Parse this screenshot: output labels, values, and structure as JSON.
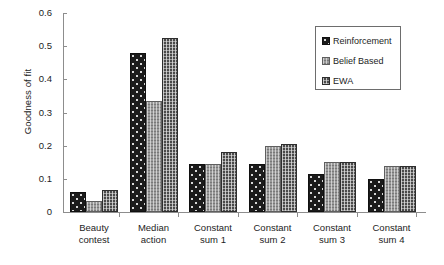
{
  "chart_data": {
    "type": "bar",
    "title": "",
    "xlabel": "",
    "ylabel": "Goodness of fit",
    "ylim": [
      0,
      0.6
    ],
    "ytick_values": [
      0,
      0.1,
      0.2,
      0.3,
      0.4,
      0.5,
      0.6
    ],
    "ytick_labels": [
      "0",
      "0.1",
      "0.2",
      "0.3",
      "0.4",
      "0.5",
      "0.6"
    ],
    "grid": false,
    "legend_position": "top-right",
    "categories": [
      "Beauty contest",
      "Median action",
      "Constant sum 1",
      "Constant sum 2",
      "Constant sum 3",
      "Constant sum 4"
    ],
    "category_lines": [
      [
        "Beauty",
        "contest"
      ],
      [
        "Median",
        "action"
      ],
      [
        "Constant",
        "sum 1"
      ],
      [
        "Constant",
        "sum 2"
      ],
      [
        "Constant",
        "sum 3"
      ],
      [
        "Constant",
        "sum 4"
      ]
    ],
    "series": [
      {
        "name": "Reinforcement",
        "pattern": "dark-dotted",
        "color": "#1b1b1b",
        "values": [
          0.06,
          0.48,
          0.145,
          0.145,
          0.115,
          0.1
        ]
      },
      {
        "name": "Belief Based",
        "pattern": "light-grey-grid",
        "color": "#9a9a9a",
        "values": [
          0.034,
          0.335,
          0.145,
          0.2,
          0.15,
          0.14
        ]
      },
      {
        "name": "EWA",
        "pattern": "mid-grey-grid",
        "color": "#4a4a4a",
        "values": [
          0.067,
          0.525,
          0.18,
          0.205,
          0.15,
          0.14
        ]
      }
    ]
  },
  "legend": {
    "items": [
      {
        "label": "Reinforcement"
      },
      {
        "label": "Belief Based"
      },
      {
        "label": "EWA"
      }
    ]
  }
}
